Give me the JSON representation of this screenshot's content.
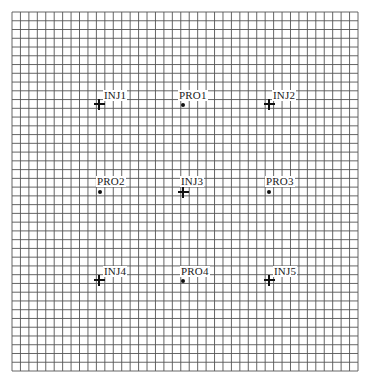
{
  "diagram": {
    "type": "well-pattern-grid",
    "grid": {
      "columns": 41,
      "rows": 41,
      "left": 12,
      "top": 12,
      "right": 358,
      "bottom": 371,
      "line_color": "#555555",
      "background": "#ffffff"
    },
    "wells": [
      {
        "label": "INJ1",
        "kind": "injector",
        "x": 99,
        "y": 104,
        "lx": 103,
        "ly": 90
      },
      {
        "label": "PRO1",
        "kind": "producer",
        "x": 183,
        "y": 105,
        "lx": 178,
        "ly": 90
      },
      {
        "label": "INJ2",
        "kind": "injector",
        "x": 269,
        "y": 104,
        "lx": 272,
        "ly": 90
      },
      {
        "label": "PRO2",
        "kind": "producer",
        "x": 100,
        "y": 192,
        "lx": 96,
        "ly": 176
      },
      {
        "label": "INJ3",
        "kind": "injector",
        "x": 183,
        "y": 192,
        "lx": 180,
        "ly": 176
      },
      {
        "label": "PRO3",
        "kind": "producer",
        "x": 269,
        "y": 192,
        "lx": 265,
        "ly": 176
      },
      {
        "label": "INJ4",
        "kind": "injector",
        "x": 99,
        "y": 280,
        "lx": 103,
        "ly": 266
      },
      {
        "label": "PRO4",
        "kind": "producer",
        "x": 183,
        "y": 281,
        "lx": 180,
        "ly": 266
      },
      {
        "label": "INJ5",
        "kind": "injector",
        "x": 269,
        "y": 280,
        "lx": 273,
        "ly": 266
      }
    ],
    "legend_icons": {
      "injector": "plus-cross-icon",
      "producer": "filled-dot-icon"
    }
  }
}
